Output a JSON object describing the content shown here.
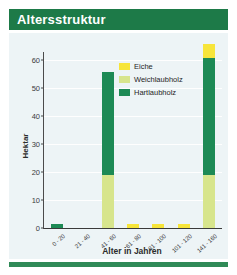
{
  "header": {
    "title": "Altersstruktur"
  },
  "colors": {
    "banner_green": "#1d7a48",
    "panel_background": "#edf4f6",
    "accent_bar": "#2f8a57",
    "eiche": "#f7e53a",
    "weichlaubholz": "#d7e58c",
    "hartlaubholz": "#1d8a55",
    "axis": "#3a3a3a",
    "gridline": "#ffffff"
  },
  "legend": {
    "position": "inside-top-right",
    "items": [
      {
        "label": "Eiche",
        "color": "#f7e53a"
      },
      {
        "label": "Weichlaubholz",
        "color": "#d7e58c"
      },
      {
        "label": "Hartlaubholz",
        "color": "#1d8a55"
      }
    ]
  },
  "chart_data": {
    "type": "bar",
    "stacked": true,
    "title": "Altersstruktur",
    "xlabel": "Alter in Jahren",
    "ylabel": "Hektar",
    "ylim": [
      0,
      63
    ],
    "yticks": [
      0,
      10,
      20,
      30,
      40,
      50,
      60
    ],
    "ytick_labels": [
      "0",
      "10",
      "20",
      "30",
      "40",
      "50",
      "60"
    ],
    "grid": true,
    "categories": [
      "0 - 20",
      "21 - 40",
      "41 - 60",
      "61 - 80",
      "81 - 100",
      "101 - 120",
      "141 - 160"
    ],
    "series": [
      {
        "name": "Hartlaubholz",
        "color": "#1d8a55",
        "values": [
          1.3,
          0,
          37.0,
          0,
          0,
          0,
          42.0
        ]
      },
      {
        "name": "Weichlaubholz",
        "color": "#d7e58c",
        "values": [
          0,
          0,
          19.0,
          0,
          0,
          0,
          19.0
        ]
      },
      {
        "name": "Eiche",
        "color": "#f7e53a",
        "values": [
          0,
          0,
          0,
          1.6,
          1.3,
          1.6,
          5.0
        ]
      }
    ],
    "stack_order": [
      "Weichlaubholz",
      "Hartlaubholz",
      "Eiche"
    ],
    "totals": [
      1.3,
      0,
      56.0,
      1.6,
      1.3,
      1.6,
      66.0
    ]
  }
}
